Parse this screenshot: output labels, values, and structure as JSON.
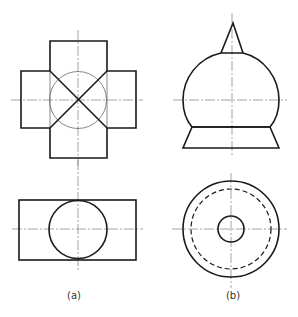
{
  "figures": [
    {
      "id": "a",
      "label": "(a)",
      "views": [
        "front-view-cross-shape-with-X-diagonals-and-circle",
        "top-view-rectangle-with-circle"
      ]
    },
    {
      "id": "b",
      "label": "(b)",
      "views": [
        "front-view-cone-dome-frustum",
        "top-view-concentric-circles-with-hidden-circle"
      ]
    }
  ],
  "colors": {
    "line": "#1a1a1a",
    "centerline": "#666666",
    "background": "#ffffff"
  }
}
